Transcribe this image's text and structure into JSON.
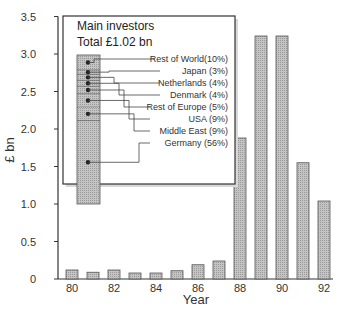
{
  "chart_data": {
    "type": "bar",
    "title": "",
    "xlabel": "Year",
    "ylabel": "£ bn",
    "ylim": [
      0,
      3.5
    ],
    "yticks": [
      "0",
      "0.5",
      "1.0",
      "1.5",
      "2.0",
      "2.5",
      "3.0",
      "3.5"
    ],
    "xtick_labels": [
      "80",
      "82",
      "84",
      "86",
      "88",
      "90",
      "92"
    ],
    "categories": [
      "80",
      "81",
      "82",
      "83",
      "84",
      "85",
      "86",
      "87",
      "88",
      "89",
      "90",
      "91",
      "92"
    ],
    "values": [
      0.12,
      0.09,
      0.12,
      0.08,
      0.08,
      0.11,
      0.19,
      0.24,
      1.88,
      3.24,
      3.24,
      1.55,
      1.04
    ],
    "grid": false,
    "bar_color": "#b4b4b4",
    "inset": {
      "title": "Main investors",
      "subtitle": "Total £1.02 bn",
      "type": "stacked-bar",
      "segments": [
        {
          "label": "Rest of World(10%)",
          "pct": 10
        },
        {
          "label": "Japan (3%)",
          "pct": 3
        },
        {
          "label": "Netherlands (4%)",
          "pct": 4
        },
        {
          "label": "Denmark (4%)",
          "pct": 4
        },
        {
          "label": "Rest of Europe (5%)",
          "pct": 5
        },
        {
          "label": "USA (9%)",
          "pct": 9
        },
        {
          "label": "Middle East (9%)",
          "pct": 9
        },
        {
          "label": "Germany (56%)",
          "pct": 56
        }
      ]
    }
  }
}
